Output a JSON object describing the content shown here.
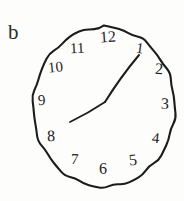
{
  "figure": {
    "panel_label": "b",
    "ink_color": "#1c1c1c",
    "background_color": "#fdfdfc"
  },
  "clock": {
    "dial": {
      "center_x": 104,
      "center_y": 107,
      "radius_x": 71,
      "radius_y": 80,
      "stroke_width": 2.1,
      "shape": "hand-drawn ellipse"
    },
    "numerals": [
      {
        "label": "12",
        "x": 100,
        "y": 29,
        "rotate": -4,
        "size": 16
      },
      {
        "label": "1",
        "x": 136,
        "y": 41,
        "rotate": 8,
        "size": 15
      },
      {
        "label": "2",
        "x": 155,
        "y": 61,
        "rotate": 4,
        "size": 16
      },
      {
        "label": "3",
        "x": 161,
        "y": 96,
        "rotate": 2,
        "size": 16
      },
      {
        "label": "4",
        "x": 152,
        "y": 131,
        "rotate": 6,
        "size": 15
      },
      {
        "label": "5",
        "x": 129,
        "y": 152,
        "rotate": -6,
        "size": 16
      },
      {
        "label": "6",
        "x": 99,
        "y": 161,
        "rotate": 0,
        "size": 16
      },
      {
        "label": "7",
        "x": 71,
        "y": 152,
        "rotate": 3,
        "size": 15
      },
      {
        "label": "8",
        "x": 47,
        "y": 128,
        "rotate": -2,
        "size": 16
      },
      {
        "label": "9",
        "x": 38,
        "y": 93,
        "rotate": -4,
        "size": 15
      },
      {
        "label": "10",
        "x": 48,
        "y": 60,
        "rotate": -6,
        "size": 15
      },
      {
        "label": "11",
        "x": 70,
        "y": 41,
        "rotate": -3,
        "size": 15
      }
    ],
    "hands": [
      {
        "name": "minute-hand",
        "points_to_numeral": "1",
        "from_x": 105,
        "from_y": 102,
        "to_x": 139,
        "to_y": 55,
        "stroke_width": 2.0
      },
      {
        "name": "hour-hand",
        "points_to_numeral": "8",
        "from_x": 105,
        "from_y": 102,
        "to_x": 70,
        "to_y": 122,
        "stroke_width": 1.8
      }
    ],
    "hand_junction": {
      "x": 105,
      "y": 102
    }
  }
}
